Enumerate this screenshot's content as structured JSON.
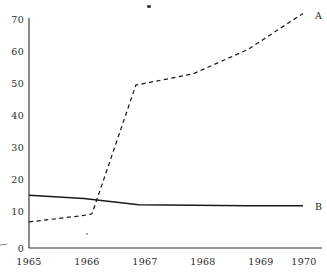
{
  "chart_data": {
    "type": "line",
    "title": "",
    "subtitle": "",
    "xlabel": "",
    "ylabel": "",
    "x": [
      1965,
      1966,
      1967,
      1968,
      1969,
      1970
    ],
    "xtick_labels": [
      "1965",
      "1966",
      "1967",
      "1968",
      "1969",
      "1970"
    ],
    "ytick_labels": [
      "0",
      "10",
      "20",
      "30",
      "40",
      "50",
      "60",
      "70"
    ],
    "yticks": [
      0,
      10,
      20,
      30,
      40,
      50,
      60,
      70
    ],
    "xlim": [
      1965,
      1970
    ],
    "ylim": [
      0,
      73
    ],
    "grid": false,
    "legend_position": "inline-right-end",
    "series": [
      {
        "name": "A",
        "label": "A",
        "style": "dashed",
        "color": "#1a1a1a",
        "x": [
          1965,
          1966,
          1966.15,
          1966.95,
          1968,
          1969,
          1970
        ],
        "values": [
          8,
          10,
          10.5,
          50,
          53.5,
          61,
          72
        ],
        "endpoint_label": "A"
      },
      {
        "name": "B",
        "label": "B",
        "style": "solid",
        "color": "#1a1a1a",
        "x": [
          1965,
          1966,
          1967,
          1968,
          1969,
          1970
        ],
        "values": [
          16.2,
          15.2,
          13.3,
          13.1,
          13.0,
          13.0
        ],
        "endpoint_label": "B"
      }
    ]
  },
  "axes": {
    "y_axis_name": "y-axis",
    "x_axis_name": "x-axis"
  },
  "artifacts": {
    "speck_top_label": "scan-speck",
    "speck_mid_label": "scan-speck",
    "edge_mark_label": "scan-edge-mark"
  }
}
